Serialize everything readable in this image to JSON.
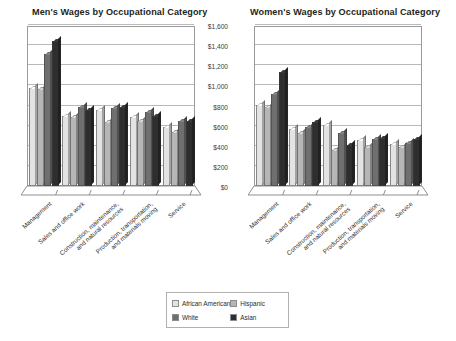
{
  "legend": {
    "position": "bottom-center",
    "entries": [
      {
        "label": "African American",
        "color": "#e3e3e3"
      },
      {
        "label": "Hispanic",
        "color": "#b6b6b6"
      },
      {
        "label": "White",
        "color": "#6f6f6f"
      },
      {
        "label": "Asian",
        "color": "#2e2e2e"
      }
    ]
  },
  "axis": {
    "ticks": [
      "$1,600",
      "$1,400",
      "$1,200",
      "$1,000",
      "$800",
      "$600",
      "$400",
      "$200",
      "$0"
    ]
  },
  "chart_data": [
    {
      "type": "bar",
      "title": "Men's Wages by Occupational Category",
      "xlabel": "",
      "ylabel": "",
      "ylim": [
        0,
        1600
      ],
      "ytick_values": [
        0,
        200,
        400,
        600,
        800,
        1000,
        1200,
        1400,
        1600
      ],
      "ytick_labels": [
        "$0",
        "$200",
        "$400",
        "$600",
        "$800",
        "$1,000",
        "$1,200",
        "$1,400",
        "$1,600"
      ],
      "grid": true,
      "legend_position": "bottom-center",
      "categories": [
        "Management",
        "Sales and office work",
        "Construction, maintenance, and natural resources",
        "Production, transportation, and materials moving",
        "Service"
      ],
      "series": [
        {
          "name": "African American",
          "color": "#e3e3e3",
          "values": [
            975,
            700,
            760,
            690,
            590
          ]
        },
        {
          "name": "Hispanic",
          "color": "#b6b6b6",
          "values": [
            960,
            690,
            640,
            650,
            540
          ]
        },
        {
          "name": "White",
          "color": "#6f6f6f",
          "values": [
            1310,
            790,
            780,
            740,
            650
          ]
        },
        {
          "name": "Asian",
          "color": "#2e2e2e",
          "values": [
            1440,
            760,
            790,
            700,
            650
          ]
        }
      ]
    },
    {
      "type": "bar",
      "title": "Women's Wages by Occupational Category",
      "xlabel": "",
      "ylabel": "",
      "ylim": [
        0,
        1600
      ],
      "ytick_values": [
        0,
        200,
        400,
        600,
        800,
        1000,
        1200,
        1400,
        1600
      ],
      "ytick_labels": [
        "$0",
        "$200",
        "$400",
        "$600",
        "$800",
        "$1,000",
        "$1,200",
        "$1,400",
        "$1,600"
      ],
      "grid": true,
      "legend_position": "bottom-center",
      "categories": [
        "Management",
        "Sales and office work",
        "Construction, maintenance, and natural resources",
        "Production, transportation, and materials moving",
        "Service"
      ],
      "series": [
        {
          "name": "African American",
          "color": "#e3e3e3",
          "values": [
            810,
            570,
            610,
            460,
            415
          ]
        },
        {
          "name": "Hispanic",
          "color": "#b6b6b6",
          "values": [
            785,
            525,
            355,
            385,
            385
          ]
        },
        {
          "name": "White",
          "color": "#6f6f6f",
          "values": [
            915,
            585,
            530,
            470,
            425
          ]
        },
        {
          "name": "Asian",
          "color": "#2e2e2e",
          "values": [
            1130,
            635,
            405,
            475,
            470
          ]
        }
      ]
    }
  ]
}
